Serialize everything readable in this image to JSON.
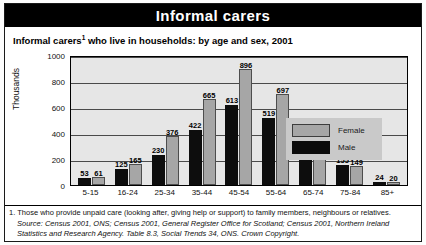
{
  "banner": {
    "title": "Informal carers"
  },
  "subtitle": {
    "pre": "Informal carers",
    "marker": "1",
    "post": " who live in households: by age and sex, 2001"
  },
  "legend": {
    "female_label": "Female",
    "male_label": "Male"
  },
  "footnotes": {
    "note1": "1. Those who provide unpaid care (looking after, giving help or support) to family members, neighbours or relatives.",
    "source": "Source: Census 2001, ONS; Census 2001, General Register Office for Scotland; Census 2001, Northern Ireland Statistics and Research Agency. Table 8.3, Social Trends 34, ONS. Crown Copyright."
  },
  "colors": {
    "male": "#0d0d0d",
    "female": "#a6a6a6",
    "plot_background": "#e6e6e6",
    "banner_background": "#000000",
    "legend_background": "#c9c9c9"
  },
  "chart_data": {
    "type": "bar",
    "xlabel": "",
    "ylabel": "Thousands",
    "ylim": [
      0,
      1000
    ],
    "yticks": [
      1000,
      800,
      600,
      400,
      200,
      0
    ],
    "grid": true,
    "legend_position": "top-right-inside",
    "categories": [
      "5-15",
      "16-24",
      "25-34",
      "35-44",
      "45-54",
      "55-64",
      "65-74",
      "75-84",
      "85+"
    ],
    "series": [
      {
        "name": "Male",
        "color": "#0d0d0d",
        "values": [
          53,
          125,
          230,
          422,
          613,
          519,
          319,
          155,
          24
        ]
      },
      {
        "name": "Female",
        "color": "#a6a6a6",
        "values": [
          61,
          165,
          376,
          665,
          896,
          697,
          370,
          149,
          20
        ]
      }
    ]
  }
}
